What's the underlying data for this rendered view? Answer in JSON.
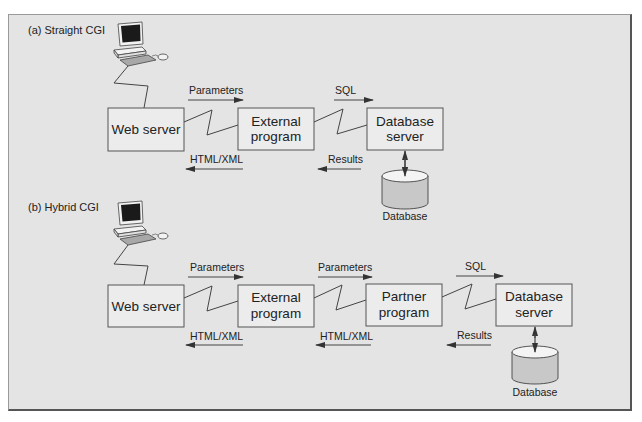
{
  "colors": {
    "frame_bg": "#e4e4e4",
    "box_fill": "#ececec",
    "line": "#444444",
    "cylinder_body": "#c8c8c8",
    "cylinder_top": "#f4f4f4",
    "monitor_screen": "#1a1a1a"
  },
  "sections": [
    {
      "label": "(a) Straight CGI",
      "nodes": [
        {
          "id": "web",
          "line1": "Web server",
          "line2": ""
        },
        {
          "id": "ext",
          "line1": "External",
          "line2": "program"
        },
        {
          "id": "dbs",
          "line1": "Database",
          "line2": "server"
        }
      ],
      "arrows": {
        "forward": [
          "Parameters",
          "SQL"
        ],
        "backward": [
          "HTML/XML",
          "Results"
        ]
      },
      "database_label": "Database"
    },
    {
      "label": "(b) Hybrid CGI",
      "nodes": [
        {
          "id": "web",
          "line1": "Web server",
          "line2": ""
        },
        {
          "id": "ext",
          "line1": "External",
          "line2": "program"
        },
        {
          "id": "partner",
          "line1": "Partner",
          "line2": "program"
        },
        {
          "id": "dbs",
          "line1": "Database",
          "line2": "server"
        }
      ],
      "arrows": {
        "forward": [
          "Parameters",
          "Parameters",
          "SQL"
        ],
        "backward": [
          "HTML/XML",
          "HTML/XML",
          "Results"
        ]
      },
      "database_label": "Database"
    }
  ]
}
